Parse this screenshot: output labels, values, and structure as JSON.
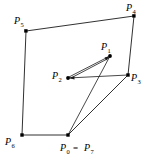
{
  "figure": {
    "width": 152,
    "height": 155,
    "background_color": "#ffffff",
    "stroke_color": "#1a1a1a",
    "vertex_color": "#000000"
  },
  "points": {
    "P0": {
      "label": "P",
      "subscript": "0",
      "x": 68,
      "y": 135
    },
    "P1": {
      "label": "P",
      "subscript": "1",
      "x": 110,
      "y": 56
    },
    "P2": {
      "label": "P",
      "subscript": "2",
      "x": 68,
      "y": 78
    },
    "P3": {
      "label": "P",
      "subscript": "3",
      "x": 128,
      "y": 75
    },
    "P4": {
      "label": "P",
      "subscript": "4",
      "x": 134,
      "y": 16
    },
    "P5": {
      "label": "P",
      "subscript": "5",
      "x": 26,
      "y": 31
    },
    "P6": {
      "label": "P",
      "subscript": "6",
      "x": 22,
      "y": 135
    },
    "P7": {
      "label": "P",
      "subscript": "7",
      "x": 68,
      "y": 135
    }
  },
  "labels": [
    {
      "name": "label-P5",
      "text": "P",
      "subscript": "5",
      "x": 14,
      "y": 22
    },
    {
      "name": "label-P4",
      "text": "P",
      "subscript": "4",
      "x": 129,
      "y": 10
    },
    {
      "name": "label-P1",
      "text": "P",
      "subscript": "1",
      "x": 103,
      "y": 49
    },
    {
      "name": "label-P2",
      "text": "P",
      "subscript": "2",
      "x": 52,
      "y": 78
    },
    {
      "name": "label-P3",
      "text": "P",
      "subscript": "3",
      "x": 131,
      "y": 80
    },
    {
      "name": "label-P6",
      "text": "P",
      "subscript": "6",
      "x": 6,
      "y": 145
    },
    {
      "name": "label-P0-eq-P7",
      "text": "P",
      "subscript": "0",
      "equals": "=",
      "text2": "P",
      "subscript2": "7",
      "x": 60,
      "y": 151
    }
  ],
  "edges": {
    "outer_polygon": "M 26,31 L 134,16 L 128,75 L 68,135 L 22,135 Z",
    "outer_description": "P5 -> P4 -> P3 -> P0/P7 -> P6 -> P5",
    "inner_path_p0_to_p1": "M 68,135 L 110,56",
    "inner_path_p1_to_p2": "M 110,56 L 68,78",
    "inner_path_p2_to_p3": "M 68,78 L 128,75"
  },
  "arrowheads": [
    {
      "name": "arrowhead-at-p1",
      "target": "P1",
      "from": "P2"
    },
    {
      "name": "arrowhead-at-p2",
      "target": "P2",
      "from": "P1"
    }
  ]
}
